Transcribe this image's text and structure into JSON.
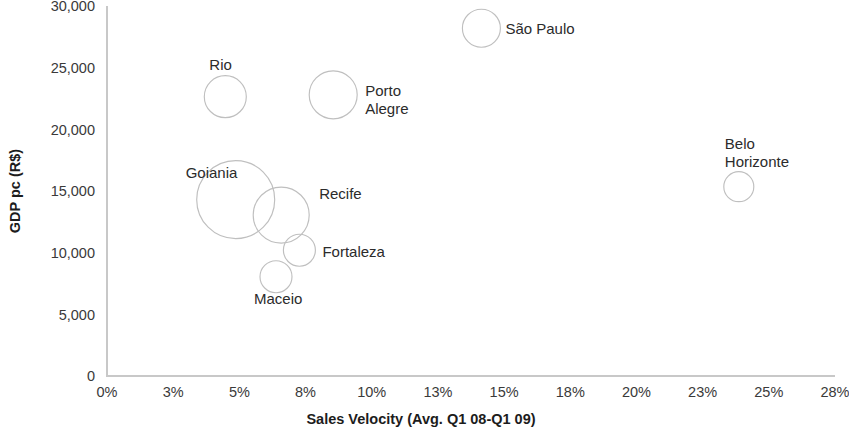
{
  "chart_data": {
    "type": "scatter",
    "variant": "bubble",
    "title": "",
    "xlabel": "Sales Velocity (Avg. Q1 08-Q1 09)",
    "ylabel": "GDP pc (R$)",
    "xlim": [
      0,
      28
    ],
    "ylim": [
      0,
      30000
    ],
    "grid": false,
    "legend": "none",
    "x_unit": "percent",
    "xticks": [
      "0%",
      "3%",
      "5%",
      "8%",
      "10%",
      "13%",
      "15%",
      "18%",
      "20%",
      "23%",
      "25%",
      "28%"
    ],
    "xtick_values": [
      0,
      2.5454,
      5.0909,
      7.6364,
      10.1818,
      12.7273,
      15.2727,
      17.8182,
      20.3636,
      22.9091,
      25.4545,
      28
    ],
    "yticks": [
      "0",
      "5,000",
      "10,000",
      "15,000",
      "20,000",
      "25,000",
      "30,000"
    ],
    "ytick_values": [
      0,
      5000,
      10000,
      15000,
      20000,
      25000,
      30000
    ],
    "points": [
      {
        "label": "São Paulo",
        "x": 14.4,
        "y": 28200,
        "size": 19,
        "label_pos": "right",
        "label_dx": 24,
        "label_dy": 6
      },
      {
        "label": "Rio",
        "x": 4.55,
        "y": 22650,
        "size": 21,
        "label_pos": "above",
        "label_dx": -16,
        "label_dy": -27
      },
      {
        "label": "Porto\nAlegre",
        "x": 8.7,
        "y": 22800,
        "size": 24,
        "label_pos": "right",
        "label_dx": 32,
        "label_dy": 1
      },
      {
        "label": "Belo\nHorizonte",
        "x": 24.3,
        "y": 15350,
        "size": 15,
        "label_pos": "above-left",
        "label_dx": -14,
        "label_dy": -38
      },
      {
        "label": "Goiania",
        "x": 4.95,
        "y": 14300,
        "size": 39,
        "label_pos": "left",
        "label_dx": -50,
        "label_dy": -22
      },
      {
        "label": "Recife",
        "x": 6.7,
        "y": 13050,
        "size": 28,
        "label_pos": "right",
        "label_dx": 38,
        "label_dy": -16
      },
      {
        "label": "Fortaleza",
        "x": 7.4,
        "y": 10200,
        "size": 16,
        "label_pos": "right",
        "label_dx": 23,
        "label_dy": 7
      },
      {
        "label": "Maceio",
        "x": 6.5,
        "y": 8050,
        "size": 16,
        "label_pos": "below-left",
        "label_dx": -22,
        "label_dy": 27
      }
    ]
  },
  "plot_geometry": {
    "left": 107,
    "right": 835,
    "top": 6,
    "bottom": 376
  }
}
